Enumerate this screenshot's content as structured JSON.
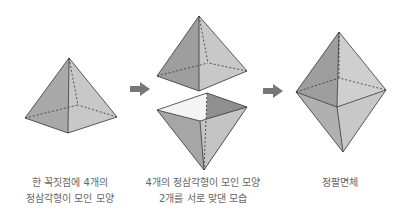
{
  "captions": {
    "first": [
      "한 꼭짓점에 4개의",
      "정삼각형이 모인 모양"
    ],
    "second": [
      "4개의 정삼각형이 모인 모양",
      "2개를 서로 맞댄 모습"
    ],
    "third": [
      "정팔면체"
    ]
  },
  "colors": {
    "dark_face": "#9a9a9a",
    "mid_face": "#b4b4b4",
    "light_face": "#cfcfcf",
    "white_face": "#f2f2f2",
    "edge": "#333333",
    "arrow": "#777777"
  }
}
